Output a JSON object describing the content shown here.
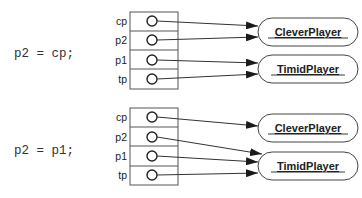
{
  "panels": [
    {
      "statement": "p2 = cp;",
      "variables": [
        {
          "name": "cp",
          "target": "CleverPlayer"
        },
        {
          "name": "p2",
          "target": "CleverPlayer"
        },
        {
          "name": "p1",
          "target": "TimidPlayer"
        },
        {
          "name": "tp",
          "target": "TimidPlayer"
        }
      ],
      "objects": [
        "CleverPlayer",
        "TimidPlayer"
      ]
    },
    {
      "statement": "p2 = p1;",
      "variables": [
        {
          "name": "cp",
          "target": "CleverPlayer"
        },
        {
          "name": "p2",
          "target": "TimidPlayer"
        },
        {
          "name": "p1",
          "target": "TimidPlayer"
        },
        {
          "name": "tp",
          "target": "TimidPlayer"
        }
      ],
      "objects": [
        "CleverPlayer",
        "TimidPlayer"
      ]
    }
  ],
  "colors": {
    "stroke": "#333333",
    "text": "#222222",
    "background": "#ffffff"
  }
}
